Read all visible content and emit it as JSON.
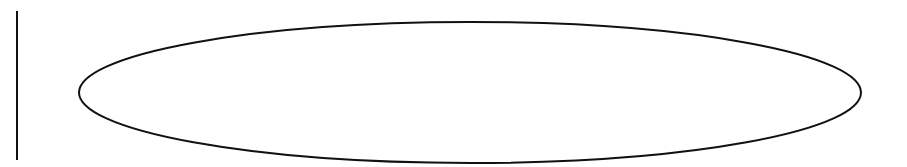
{
  "canvas": {
    "width": 907,
    "height": 167,
    "background": "#ffffff"
  },
  "shapes": {
    "vertical_line": {
      "x": 17,
      "y1": 11,
      "y2": 160,
      "stroke": "#111111",
      "stroke_width": 2
    },
    "ellipse": {
      "cx": 470,
      "cy": 92.5,
      "rx": 391,
      "ry": 70.5,
      "stroke": "#111111",
      "stroke_width": 2,
      "fill": "none"
    }
  }
}
